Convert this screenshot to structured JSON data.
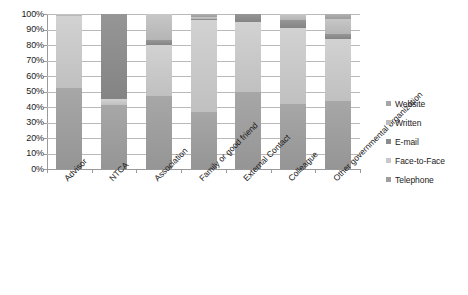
{
  "chart_data": {
    "type": "bar",
    "subtype": "stacked-percentage-column",
    "title": "",
    "xlabel": "",
    "ylabel": "",
    "ylim": [
      0,
      100
    ],
    "ytick_labels": [
      "100%",
      "90%",
      "80%",
      "70%",
      "60%",
      "50%",
      "40%",
      "30%",
      "20%",
      "10%",
      "0%"
    ],
    "ytick_values": [
      100,
      90,
      80,
      70,
      60,
      50,
      40,
      30,
      20,
      10,
      0
    ],
    "grid": true,
    "legend_position": "right",
    "categories": [
      "Advisor",
      "NTCA",
      "Association",
      "Family or good friend",
      "External Contact",
      "Colleague",
      "Other governmental organization"
    ],
    "series": [
      {
        "name": "Telephone",
        "color": "#9d9d9d",
        "values": [
          52,
          41,
          47,
          37,
          50,
          42,
          44
        ]
      },
      {
        "name": "Face-to-Face",
        "color": "#c8c8c8",
        "values": [
          47,
          4,
          33,
          59,
          45,
          49,
          40
        ]
      },
      {
        "name": "E-mail",
        "color": "#8c8c8c",
        "values": [
          0,
          55,
          3,
          1,
          5,
          5,
          3
        ]
      },
      {
        "name": "Written",
        "color": "#bdbdbd",
        "values": [
          1,
          0,
          17,
          1,
          0,
          4,
          10
        ]
      },
      {
        "name": "Website",
        "color": "#a6a6a6",
        "values": [
          0,
          0,
          0,
          2,
          0,
          0,
          3
        ]
      }
    ]
  },
  "legend": {
    "items": [
      {
        "label": "Website",
        "color": "#a6a6a6"
      },
      {
        "label": "Written",
        "color": "#bdbdbd"
      },
      {
        "label": "E-mail",
        "color": "#8c8c8c"
      },
      {
        "label": "Face-to-Face",
        "color": "#c8c8c8"
      },
      {
        "label": "Telephone",
        "color": "#9d9d9d"
      }
    ]
  }
}
